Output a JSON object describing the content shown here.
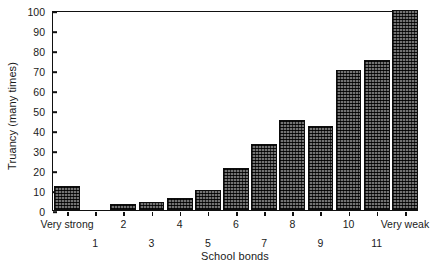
{
  "chart_data": {
    "type": "bar",
    "title": "",
    "subtitle": "",
    "xlabel": "School bonds",
    "ylabel": "Truancy (many times)",
    "categories": [
      "Very strong",
      "1",
      "2",
      "3",
      "4",
      "5",
      "6",
      "7",
      "8",
      "9",
      "10",
      "11",
      "Very weak"
    ],
    "values": [
      12,
      0,
      3,
      4,
      6,
      10,
      21,
      33,
      45,
      42,
      70,
      75,
      100
    ],
    "ylim": [
      0,
      100
    ],
    "ytick_labels": [
      "0",
      "10",
      "20",
      "30",
      "40",
      "50",
      "60",
      "70",
      "80",
      "90",
      "100"
    ],
    "ytick_values": [
      0,
      10,
      20,
      30,
      40,
      50,
      60,
      70,
      80,
      90,
      100
    ],
    "xtick_rows": [
      {
        "row": 0,
        "labels": [
          "Very strong",
          "2",
          "4",
          "6",
          "8",
          "10",
          "Very weak"
        ],
        "indices": [
          0,
          2,
          4,
          6,
          8,
          10,
          12
        ]
      },
      {
        "row": 1,
        "labels": [
          "1",
          "3",
          "5",
          "7",
          "9",
          "11"
        ],
        "indices": [
          1,
          3,
          5,
          7,
          9,
          11
        ]
      }
    ],
    "grid": false,
    "legend": null,
    "bar_fill": "#4a4a4a",
    "bar_edge": "#0d0d0d",
    "axis_color": "#111111",
    "background": "#ffffff"
  }
}
